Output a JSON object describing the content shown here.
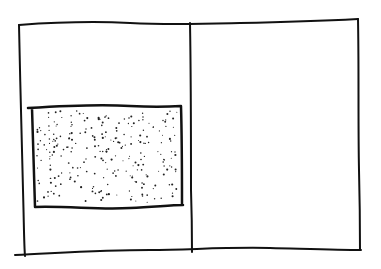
{
  "sketch": {
    "description": "Hand-drawn wireframe: frame divided into two panels, stippled block in left panel",
    "stroke_color": "#111111",
    "background": "#ffffff",
    "outer_frame": {
      "x": 19,
      "y": 24,
      "w": 341,
      "h": 230
    },
    "divider_x": 191,
    "stippled_block": {
      "x": 33,
      "y": 107,
      "w": 148,
      "h": 100
    },
    "panels": [
      {
        "id": "left-panel",
        "content": "stippled-block"
      },
      {
        "id": "right-panel",
        "content": "empty"
      }
    ]
  }
}
